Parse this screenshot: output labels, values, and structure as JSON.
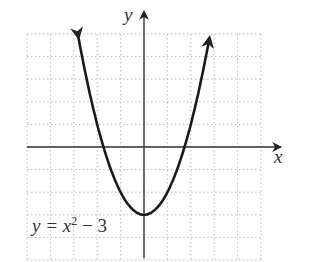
{
  "chart_data": {
    "type": "line",
    "title": "",
    "equation_label": "y = x² − 3",
    "equation_parts": {
      "lhs": "y = x",
      "exp": "2",
      "rhs": " − 3"
    },
    "xlabel": "x",
    "ylabel": "y",
    "xlim": [
      -5,
      5
    ],
    "ylim": [
      -5,
      5
    ],
    "grid": true,
    "grid_style": "dotted",
    "series": [
      {
        "name": "y = x^2 - 3",
        "x": [
          -2.8,
          -2.5,
          -2,
          -1.73,
          -1.5,
          -1,
          -0.5,
          0,
          0.5,
          1,
          1.5,
          1.73,
          2,
          2.5,
          2.8
        ],
        "y": [
          4.84,
          3.25,
          1,
          0,
          -0.75,
          -2,
          -2.75,
          -3,
          -2.75,
          -2,
          -0.75,
          0,
          1,
          3.25,
          4.84
        ]
      }
    ],
    "vertex": [
      0,
      -3
    ],
    "x_intercepts": [
      -1.73,
      1.73
    ]
  },
  "labels": {
    "x_axis": "x",
    "y_axis": "y"
  }
}
